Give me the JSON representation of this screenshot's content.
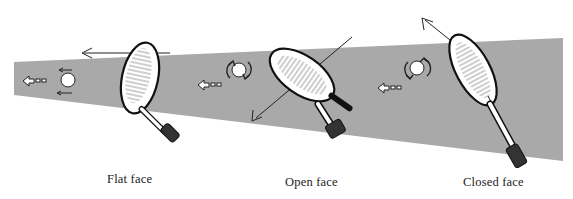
{
  "diagram": {
    "band_color": "#a9a9a9",
    "line_color": "#1a1a1a",
    "panels": [
      {
        "id": "flat",
        "label": "Flat face"
      },
      {
        "id": "open",
        "label": "Open face"
      },
      {
        "id": "closed",
        "label": "Closed face"
      }
    ]
  }
}
